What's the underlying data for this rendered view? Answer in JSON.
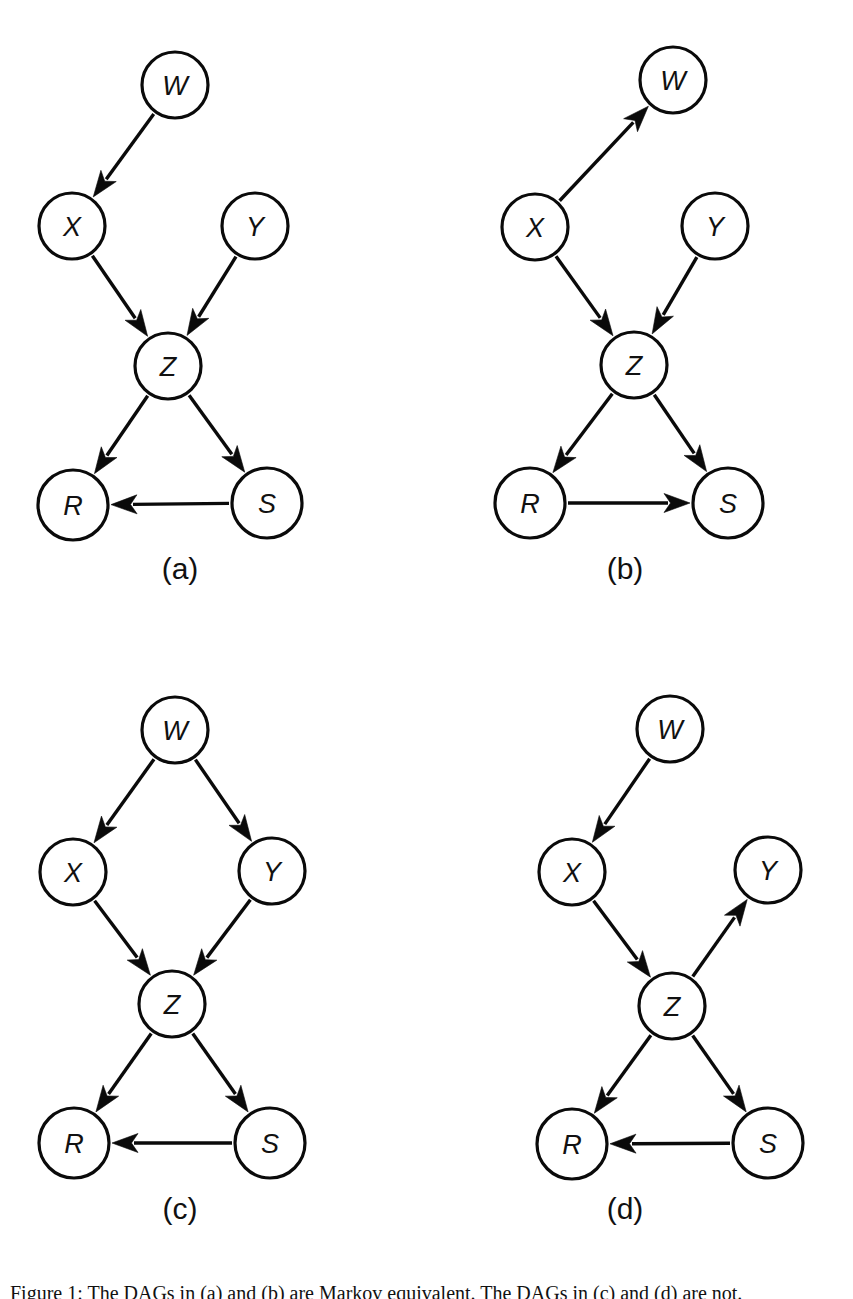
{
  "figure": {
    "background_color": "#ffffff",
    "ink_color": "#0a0a0a",
    "caption": "Figure 1:  The DAGs in (a) and (b) are Markov equivalent. The DAGs in (c) and (d) are not."
  },
  "panels": [
    {
      "id": "a",
      "caption": "(a)",
      "nodes": [
        {
          "name": "W",
          "label": "W",
          "cx": 175,
          "cy": 85,
          "r": 33
        },
        {
          "name": "X",
          "label": "X",
          "cx": 72,
          "cy": 226,
          "r": 33
        },
        {
          "name": "Y",
          "label": "Y",
          "cx": 255,
          "cy": 226,
          "r": 33
        },
        {
          "name": "Z",
          "label": "Z",
          "cx": 168,
          "cy": 366,
          "r": 33
        },
        {
          "name": "R",
          "label": "R",
          "cx": 73,
          "cy": 505,
          "r": 35
        },
        {
          "name": "S",
          "label": "S",
          "cx": 267,
          "cy": 503,
          "r": 35
        }
      ],
      "edges": [
        {
          "from": "W",
          "to": "X"
        },
        {
          "from": "X",
          "to": "Z"
        },
        {
          "from": "Y",
          "to": "Z"
        },
        {
          "from": "Z",
          "to": "R"
        },
        {
          "from": "Z",
          "to": "S"
        },
        {
          "from": "S",
          "to": "R"
        }
      ]
    },
    {
      "id": "b",
      "caption": "(b)",
      "nodes": [
        {
          "name": "W",
          "label": "W",
          "cx": 253,
          "cy": 80,
          "r": 33
        },
        {
          "name": "X",
          "label": "X",
          "cx": 115,
          "cy": 227,
          "r": 33
        },
        {
          "name": "Y",
          "label": "Y",
          "cx": 295,
          "cy": 226,
          "r": 33
        },
        {
          "name": "Z",
          "label": "Z",
          "cx": 214,
          "cy": 365,
          "r": 33
        },
        {
          "name": "R",
          "label": "R",
          "cx": 110,
          "cy": 503,
          "r": 35
        },
        {
          "name": "S",
          "label": "S",
          "cx": 308,
          "cy": 503,
          "r": 35
        }
      ],
      "edges": [
        {
          "from": "X",
          "to": "W"
        },
        {
          "from": "X",
          "to": "Z"
        },
        {
          "from": "Y",
          "to": "Z"
        },
        {
          "from": "Z",
          "to": "R"
        },
        {
          "from": "Z",
          "to": "S"
        },
        {
          "from": "R",
          "to": "S"
        }
      ]
    },
    {
      "id": "c",
      "caption": "(c)",
      "nodes": [
        {
          "name": "W",
          "label": "W",
          "cx": 175,
          "cy": 90,
          "r": 33
        },
        {
          "name": "X",
          "label": "X",
          "cx": 73,
          "cy": 232,
          "r": 33
        },
        {
          "name": "Y",
          "label": "Y",
          "cx": 272,
          "cy": 231,
          "r": 33
        },
        {
          "name": "Z",
          "label": "Z",
          "cx": 172,
          "cy": 364,
          "r": 33
        },
        {
          "name": "R",
          "label": "R",
          "cx": 74,
          "cy": 503,
          "r": 35
        },
        {
          "name": "S",
          "label": "S",
          "cx": 270,
          "cy": 503,
          "r": 35
        }
      ],
      "edges": [
        {
          "from": "W",
          "to": "X"
        },
        {
          "from": "W",
          "to": "Y"
        },
        {
          "from": "X",
          "to": "Z"
        },
        {
          "from": "Y",
          "to": "Z"
        },
        {
          "from": "Z",
          "to": "R"
        },
        {
          "from": "Z",
          "to": "S"
        },
        {
          "from": "S",
          "to": "R"
        }
      ]
    },
    {
      "id": "d",
      "caption": "(d)",
      "nodes": [
        {
          "name": "W",
          "label": "W",
          "cx": 250,
          "cy": 89,
          "r": 33
        },
        {
          "name": "X",
          "label": "X",
          "cx": 152,
          "cy": 232,
          "r": 33
        },
        {
          "name": "Y",
          "label": "Y",
          "cx": 348,
          "cy": 230,
          "r": 33
        },
        {
          "name": "Z",
          "label": "Z",
          "cx": 252,
          "cy": 366,
          "r": 33
        },
        {
          "name": "R",
          "label": "R",
          "cx": 152,
          "cy": 504,
          "r": 35
        },
        {
          "name": "S",
          "label": "S",
          "cx": 348,
          "cy": 503,
          "r": 35
        }
      ],
      "edges": [
        {
          "from": "W",
          "to": "X"
        },
        {
          "from": "X",
          "to": "Z"
        },
        {
          "from": "Z",
          "to": "Y"
        },
        {
          "from": "Z",
          "to": "R"
        },
        {
          "from": "Z",
          "to": "S"
        },
        {
          "from": "S",
          "to": "R"
        }
      ]
    }
  ],
  "layout": {
    "panel_boxes": [
      {
        "id": "a",
        "left": 0,
        "top": 0,
        "width": 420,
        "height": 600
      },
      {
        "id": "b",
        "left": 420,
        "top": 0,
        "width": 433,
        "height": 600
      },
      {
        "id": "c",
        "left": 0,
        "top": 640,
        "width": 420,
        "height": 600
      },
      {
        "id": "d",
        "left": 420,
        "top": 640,
        "width": 433,
        "height": 600
      }
    ],
    "caption_positions": [
      {
        "id": "a",
        "left": 100,
        "top": 552
      },
      {
        "id": "b",
        "left": 545,
        "top": 552
      },
      {
        "id": "c",
        "left": 100,
        "top": 1192
      },
      {
        "id": "d",
        "left": 545,
        "top": 1192
      }
    ]
  }
}
